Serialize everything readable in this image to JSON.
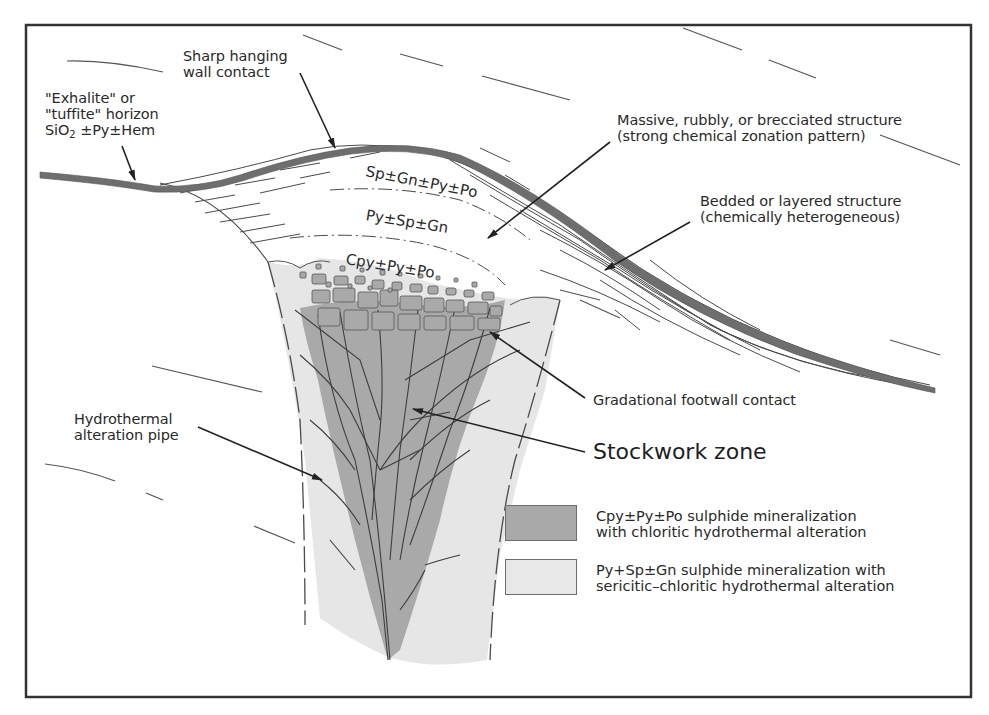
{
  "figure": {
    "type": "geological cross-section schematic"
  },
  "colors": {
    "frame": "#333333",
    "horizon_band": "#6e6e6e",
    "chloritic_alteration": "#a9a9a9",
    "sericitic_alteration": "#e6e6e6",
    "line": "#4a4a4a",
    "text": "#2a2a2a",
    "background": "#ffffff"
  },
  "labels": {
    "hanging_wall": [
      "Sharp hanging",
      "wall contact"
    ],
    "exhalite": [
      "\"Exhalite\" or",
      "\"tuffite\" horizon"
    ],
    "exhalite_formula_prefix": "SiO",
    "exhalite_formula_sub": "2",
    "exhalite_formula_suffix": " ±Py±Hem",
    "massive": [
      "Massive, rubbly, or brecciated structure",
      "(strong chemical zonation pattern)"
    ],
    "bedded": [
      "Bedded or layered structure",
      "(chemically heterogeneous)"
    ],
    "gradational": "Gradational footwall contact",
    "stockwork": "Stockwork zone",
    "pipe": [
      "Hydrothermal",
      "alteration pipe"
    ]
  },
  "zones": {
    "upper": "Sp±Gn±Py±Po",
    "middle": "Py±Sp±Gn",
    "lower": "Cpy±Py±Po"
  },
  "legend": {
    "items": [
      {
        "swatch": "dark-gray",
        "lines": [
          "Cpy±Py±Po sulphide mineralization",
          "with chloritic hydrothermal alteration"
        ]
      },
      {
        "swatch": "light-gray",
        "lines": [
          "Py+Sp±Gn sulphide mineralization with",
          "sericitic–chloritic hydrothermal alteration"
        ]
      }
    ]
  }
}
